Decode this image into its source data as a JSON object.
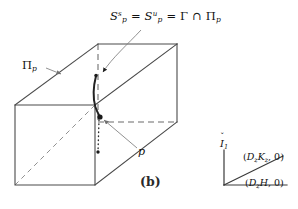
{
  "figure": {
    "caption": "(b)",
    "background_color": "#ffffff",
    "stroke_color": "#4a4a4a",
    "curve_color": "#232323",
    "leader_color": "#7d7d7d"
  },
  "labels": {
    "formula": {
      "S_letter": "S",
      "sup_stable": "s",
      "sub_point_1": "p",
      "equals_1": "=",
      "S_letter_2": "S",
      "sup_unstable": "u",
      "sub_point_2": "p",
      "equals_2": "=",
      "gamma": "Γ",
      "intersection": "∩",
      "pi": "Π",
      "sub_pi": "p"
    },
    "plane": {
      "pi": "Π",
      "sub": "p"
    },
    "point": {
      "name": "p"
    },
    "caption": "(b)",
    "axis_vertical": {
      "symbol": "I",
      "sub": "1"
    },
    "coord_upper": {
      "open": "(",
      "D": "D",
      "D_sub": "z",
      "K": "K",
      "K_sub": "z",
      "comma_zero": ", 0)"
    },
    "coord_lower": {
      "open": "(",
      "D": "D",
      "D_sub": "z",
      "H": "H",
      "comma_zero": ", 0)"
    }
  },
  "geometry": {
    "box_description": "oblique-projection rectangular slab",
    "front_face": {
      "x": 15,
      "y": 105,
      "width": 80,
      "height": 80
    },
    "back_face": {
      "x": 98,
      "y": 44,
      "width": 79,
      "height": 78
    },
    "depth_offset": {
      "dx": 83,
      "dy": -61
    },
    "point_p": {
      "x": 100,
      "y": 117
    },
    "dotted_tail_end": {
      "x": 98,
      "y": 152
    },
    "manifold_top": {
      "x": 96,
      "y": 76
    },
    "axis_origin": {
      "x": 224,
      "y": 185
    },
    "axis_vertical_top": {
      "x": 224,
      "y": 150
    },
    "axis_horizontal_end": {
      "x": 287,
      "y": 185
    },
    "axis_diagonal_end": {
      "x": 283,
      "y": 156
    }
  }
}
